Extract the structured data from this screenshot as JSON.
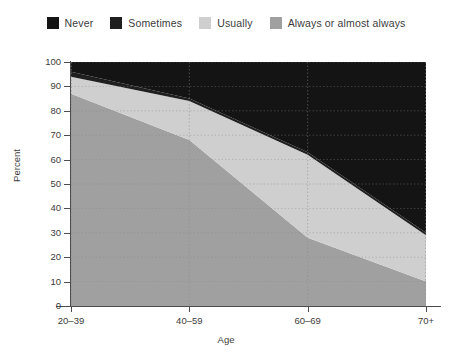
{
  "chart_data": {
    "type": "area",
    "title": "",
    "xlabel": "Age",
    "ylabel": "Percent",
    "categories": [
      "20–39",
      "40–59",
      "60–69",
      "70+"
    ],
    "ylim": [
      0,
      100
    ],
    "ytick_labels": [
      "0",
      "10",
      "20",
      "30",
      "40",
      "50",
      "60",
      "70",
      "80",
      "90",
      "100"
    ],
    "ytick_values": [
      0,
      10,
      20,
      30,
      40,
      50,
      60,
      70,
      80,
      90,
      100
    ],
    "grid": true,
    "stacked": true,
    "stack_order_bottom_to_top": [
      "Always or almost always",
      "Usually",
      "Sometimes",
      "Never"
    ],
    "legend_position": "top",
    "series": [
      {
        "name": "Never",
        "color": "#141414",
        "values": [
          4,
          15,
          37,
          70
        ]
      },
      {
        "name": "Sometimes",
        "color": "#1f1f1f",
        "values": [
          2,
          1,
          1,
          1
        ]
      },
      {
        "name": "Usually",
        "color": "#cfcfcf",
        "values": [
          7,
          16,
          34,
          19
        ]
      },
      {
        "name": "Always or almost always",
        "color": "#a0a0a0",
        "values": [
          87,
          68,
          28,
          10
        ]
      }
    ],
    "cumulative_top_boundaries": {
      "always_top": [
        87,
        68,
        28,
        10
      ],
      "usually_top": [
        94,
        84,
        62,
        29
      ],
      "sometimes_top": [
        96,
        85,
        63,
        30
      ],
      "never_top": [
        100,
        100,
        100,
        100
      ]
    }
  },
  "legend": {
    "items": [
      {
        "label": "Never",
        "color": "#141414"
      },
      {
        "label": "Sometimes",
        "color": "#1f1f1f"
      },
      {
        "label": "Usually",
        "color": "#cfcfcf"
      },
      {
        "label": "Always or almost always",
        "color": "#a0a0a0"
      }
    ]
  },
  "axes": {
    "x_title": "Age",
    "y_title": "Percent",
    "x_labels": [
      "20–39",
      "40–59",
      "60–69",
      "70+"
    ],
    "y_labels": [
      "100",
      "90",
      "80",
      "70",
      "60",
      "50",
      "40",
      "30",
      "20",
      "10",
      "0"
    ]
  },
  "colors": {
    "background": "#ffffff",
    "axis": "#4d4d4d",
    "text": "#3c3c3c",
    "grid": "#8a8a8a"
  }
}
